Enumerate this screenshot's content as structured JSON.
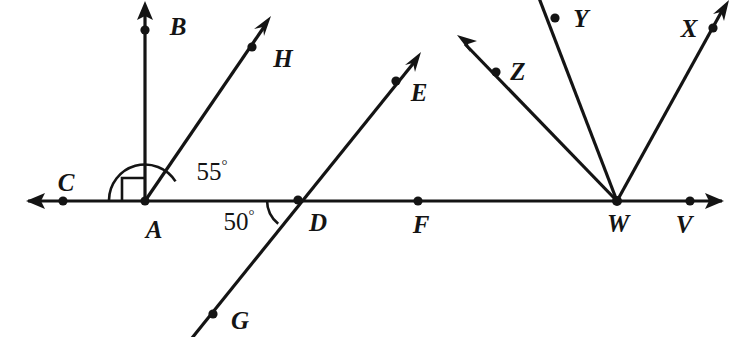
{
  "figure": {
    "kind": "geometry-diagram",
    "stroke_color": "#141414",
    "background_color": "#ffffff",
    "point_labels": [
      {
        "name": "B",
        "text": "B",
        "x": 178,
        "y": 26
      },
      {
        "name": "H",
        "text": "H",
        "x": 283,
        "y": 58
      },
      {
        "name": "E",
        "text": "E",
        "x": 419,
        "y": 92
      },
      {
        "name": "C",
        "text": "C",
        "x": 66,
        "y": 182
      },
      {
        "name": "A",
        "text": "A",
        "x": 154,
        "y": 229
      },
      {
        "name": "D",
        "text": "D",
        "x": 318,
        "y": 222
      },
      {
        "name": "F",
        "text": "F",
        "x": 421,
        "y": 224
      },
      {
        "name": "G",
        "text": "G",
        "x": 240,
        "y": 320
      },
      {
        "name": "Z",
        "text": "Z",
        "x": 518,
        "y": 71
      },
      {
        "name": "Y",
        "text": "Y",
        "x": 581,
        "y": 18
      },
      {
        "name": "X",
        "text": "X",
        "x": 689,
        "y": 28
      },
      {
        "name": "W",
        "text": "W",
        "x": 618,
        "y": 223
      },
      {
        "name": "V",
        "text": "V",
        "x": 684,
        "y": 224
      }
    ],
    "angle_labels": [
      {
        "name": "angle-BAH",
        "value": "55",
        "unit": "°",
        "x": 212,
        "y": 171
      },
      {
        "name": "angle-ADG",
        "value": "50",
        "unit": "°",
        "x": 239,
        "y": 221
      }
    ],
    "marked_points": [
      {
        "name": "point-B",
        "x": 145,
        "y": 30
      },
      {
        "name": "point-H",
        "x": 252,
        "y": 47
      },
      {
        "name": "point-E",
        "x": 396,
        "y": 81
      },
      {
        "name": "point-C",
        "x": 63,
        "y": 201
      },
      {
        "name": "point-A",
        "x": 145,
        "y": 200
      },
      {
        "name": "point-D",
        "x": 298,
        "y": 200
      },
      {
        "name": "point-F",
        "x": 418,
        "y": 201
      },
      {
        "name": "point-G",
        "x": 213,
        "y": 314
      },
      {
        "name": "point-Z",
        "x": 496,
        "y": 72
      },
      {
        "name": "point-Y",
        "x": 555,
        "y": 18
      },
      {
        "name": "point-X",
        "x": 713,
        "y": 28
      },
      {
        "name": "point-W",
        "x": 617,
        "y": 200
      },
      {
        "name": "point-V",
        "x": 690,
        "y": 201
      }
    ],
    "segments": [
      {
        "name": "line-CV-horizontal",
        "x1": 28,
        "y1": 201,
        "x2": 722,
        "y2": 201
      },
      {
        "name": "ray-AB-vertical",
        "x1": 145,
        "y1": 200,
        "x2": 145,
        "y2": 8
      },
      {
        "name": "ray-AH",
        "x1": 145,
        "y1": 200,
        "x2": 268,
        "y2": 22
      },
      {
        "name": "line-GE",
        "x1": 193,
        "y1": 337,
        "x2": 418,
        "y2": 58
      },
      {
        "name": "ray-WZ",
        "x1": 617,
        "y1": 200,
        "x2": 463,
        "y2": 42
      },
      {
        "name": "ray-WY",
        "x1": 617,
        "y1": 200,
        "x2": 539,
        "y2": 0
      },
      {
        "name": "ray-WX",
        "x1": 617,
        "y1": 200,
        "x2": 725,
        "y2": 7
      }
    ],
    "arrowheads": [
      {
        "name": "arrow-C-left",
        "x": 28,
        "y": 201,
        "angle": 180
      },
      {
        "name": "arrow-V-right",
        "x": 722,
        "y": 201,
        "angle": 0
      },
      {
        "name": "arrow-B-up",
        "x": 145,
        "y": 4,
        "angle": -90
      },
      {
        "name": "arrow-H-up-right",
        "x": 270,
        "y": 18,
        "angle": -55
      },
      {
        "name": "arrow-E-up-right",
        "x": 420,
        "y": 54,
        "angle": -51
      },
      {
        "name": "arrow-Z-up-left",
        "x": 459,
        "y": 37,
        "angle": -134
      },
      {
        "name": "arrow-X-up-right",
        "x": 728,
        "y": 3,
        "angle": -61
      }
    ],
    "right_angle_marker": {
      "name": "right-angle-marker-CAB",
      "x": 122,
      "y": 177,
      "size": 23
    },
    "angle_arcs": [
      {
        "name": "arc-55-at-A",
        "cx": 145,
        "cy": 200,
        "r": 36
      },
      {
        "name": "arc-50-at-D",
        "cx": 298,
        "cy": 200,
        "r": 31
      }
    ]
  }
}
